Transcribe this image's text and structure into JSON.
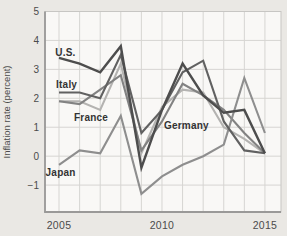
{
  "figure": {
    "y_axis_title": "Inflation rate (percent)"
  },
  "colors": {
    "page_bg": "#eae8e4",
    "plot_bg": "#f9f8f6",
    "grid": "#d6d5d2",
    "frame": "#c7c6c3",
    "axis": "#9a9998",
    "tick_text": "#4b4b4b",
    "label_text": "#333333"
  },
  "chart_data": {
    "type": "line",
    "title": "",
    "xlabel": "",
    "ylabel": "Inflation rate (percent)",
    "grid": true,
    "legend_position": "inline-labels",
    "x": [
      2005,
      2006,
      2007,
      2008,
      2009,
      2010,
      2011,
      2012,
      2013,
      2014,
      2015
    ],
    "series": [
      {
        "name": "france",
        "label": "France",
        "color": "#b4b3b1",
        "values": [
          1.9,
          1.9,
          1.6,
          3.2,
          0.1,
          1.7,
          2.3,
          2.2,
          1.0,
          0.6,
          0.1
        ]
      },
      {
        "name": "germany",
        "label": "Germany",
        "color": "#828282",
        "values": [
          1.9,
          1.8,
          2.3,
          2.8,
          0.2,
          1.2,
          2.5,
          2.1,
          1.6,
          0.8,
          0.1
        ]
      },
      {
        "name": "japan",
        "label": "Japan",
        "color": "#8e8e8e",
        "values": [
          -0.3,
          0.2,
          0.1,
          1.4,
          -1.3,
          -0.7,
          -0.3,
          0.0,
          0.4,
          2.7,
          0.8
        ]
      },
      {
        "name": "italy",
        "label": "Italy",
        "color": "#616161",
        "values": [
          2.2,
          2.2,
          2.0,
          3.5,
          0.8,
          1.6,
          2.9,
          3.3,
          1.2,
          0.2,
          0.1
        ]
      },
      {
        "name": "us",
        "label": "U.S.",
        "color": "#4d4d4d",
        "values": [
          3.4,
          3.2,
          2.9,
          3.8,
          -0.4,
          1.6,
          3.2,
          2.1,
          1.5,
          1.6,
          0.1
        ]
      }
    ],
    "annotations": [
      {
        "name": "us",
        "text": "U.S.",
        "x": 2004.82,
        "y": 3.47
      },
      {
        "name": "italy",
        "text": "Italy",
        "x": 2004.86,
        "y": 2.35
      },
      {
        "name": "france",
        "text": "France",
        "x": 2005.73,
        "y": 1.21
      },
      {
        "name": "germany",
        "text": "Germany",
        "x": 2010.1,
        "y": 0.93
      },
      {
        "name": "japan",
        "text": "Japan",
        "x": 2004.35,
        "y": -0.69
      }
    ],
    "x_ticks": [
      2005,
      2010,
      2015
    ],
    "y_ticks": [
      5,
      4,
      3,
      2,
      1,
      0,
      -1
    ],
    "x_grid_years": [
      2005,
      2006,
      2007,
      2008,
      2009,
      2010,
      2011,
      2012,
      2013,
      2014,
      2015
    ],
    "xlim": [
      2004.32,
      2015.78
    ],
    "ylim": [
      -1.93,
      5.0
    ]
  }
}
